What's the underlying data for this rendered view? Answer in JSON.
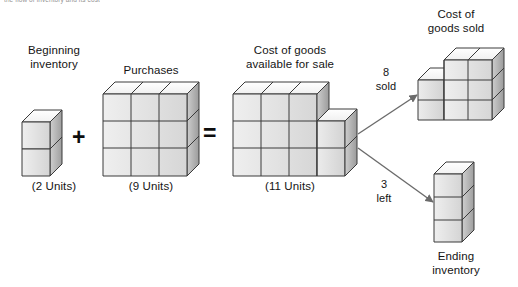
{
  "page": {
    "cut_header_text": "the flow of inventory and its cost",
    "background": "#ffffff"
  },
  "colors": {
    "top_face": "#fdfdfd",
    "front_face_light": "#f4f4f4",
    "front_face_dark": "#cfcfcf",
    "side_face_light": "#d2d2d2",
    "side_face_dark": "#9c9c9c",
    "outline": "#3a3a3a",
    "arrow": "#6b6b6b",
    "text": "#141414"
  },
  "operators": {
    "plus": "+",
    "equals": "="
  },
  "groups": {
    "beginning_inventory": {
      "title": "Beginning\ninventory",
      "units_label": "(2 Units)",
      "units": 2,
      "shape": "1 wide x 2 tall"
    },
    "purchases": {
      "title": "Purchases",
      "units_label": "(9 Units)",
      "units": 9,
      "shape": "3 wide x 3 tall"
    },
    "goods_available": {
      "title": "Cost of goods\navailable for sale",
      "units_label": "(11 Units)",
      "units": 11,
      "shape": "3 wide x 3 tall plus 1 wide x 2 tall step"
    },
    "cost_of_goods_sold": {
      "title": "Cost of\ngoods sold",
      "units": 8,
      "shape": "3 wide x 2 tall plus 2 wide x 1 tall top step"
    },
    "ending_inventory": {
      "title": "Ending\ninventory",
      "units": 3,
      "shape": "1 wide x 3 tall"
    }
  },
  "arrows": {
    "sold": {
      "line1": "8",
      "line2": "sold"
    },
    "left": {
      "line1": "3",
      "line2": "left"
    }
  }
}
